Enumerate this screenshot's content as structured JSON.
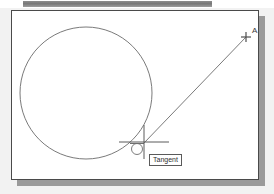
{
  "window": {
    "title": "",
    "top_bar": {
      "name": "toolbar-strip",
      "color": "#808080"
    },
    "background_color": "#f2f2f2",
    "panel": {
      "background_color": "#ffffff",
      "border_color": "#4a4a4a",
      "shadow_color": "#9a9a9a"
    }
  },
  "drawing": {
    "line_color": "#6b6b6b",
    "cursor_color": "#555555",
    "circle": {
      "name": "circle-entity",
      "cx": 74,
      "cy": 82,
      "r": 66
    },
    "tangent_line": {
      "name": "tangent-line-entity",
      "x1": 234,
      "y1": 26,
      "x2": 132,
      "y2": 132
    },
    "point_a": {
      "label": "A",
      "marker": "plus",
      "x": 234,
      "y": 26
    },
    "crosshair": {
      "name": "crosshair-cursor",
      "x": 132,
      "y": 131,
      "h_half_width": 25,
      "v_half_height": 17
    },
    "osnap_marker": {
      "name": "tangent-osnap-marker",
      "type": "tangent",
      "x": 125,
      "y": 137
    }
  },
  "tooltip": {
    "label": "Tangent"
  }
}
